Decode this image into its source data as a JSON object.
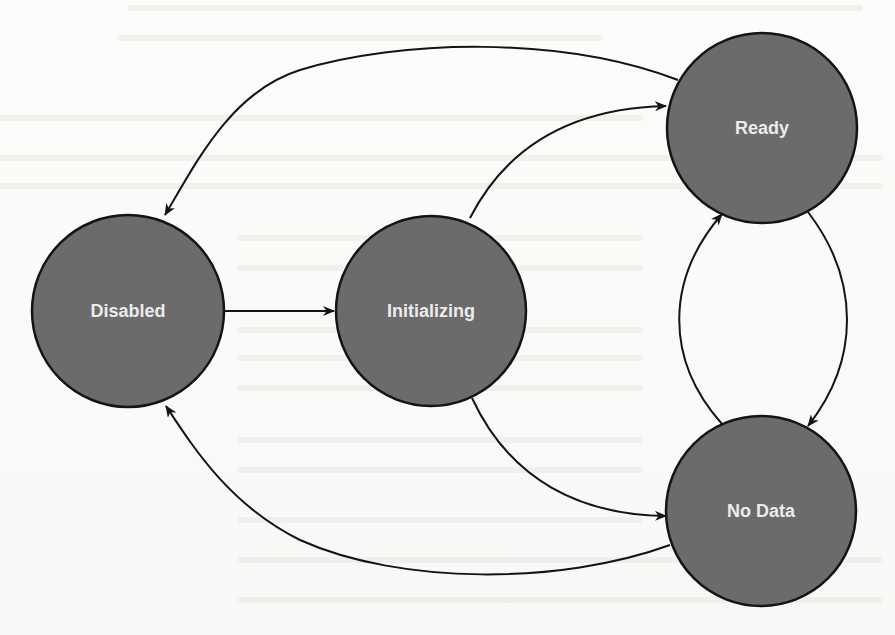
{
  "diagram": {
    "type": "state-transition",
    "colors": {
      "node_fill": "#6b6b6b",
      "node_stroke": "#141414",
      "edge": "#141414",
      "label": "#ececec",
      "background": "#fbfbfa"
    },
    "nodes": [
      {
        "id": "disabled",
        "label": "Disabled",
        "cx": 128,
        "cy": 311,
        "r": 96
      },
      {
        "id": "initializing",
        "label": "Initializing",
        "cx": 431,
        "cy": 311,
        "r": 95
      },
      {
        "id": "ready",
        "label": "Ready",
        "cx": 762,
        "cy": 128,
        "r": 95
      },
      {
        "id": "no_data",
        "label": "No Data",
        "cx": 761,
        "cy": 511,
        "r": 95
      }
    ],
    "edges": [
      {
        "from": "disabled",
        "to": "initializing"
      },
      {
        "from": "initializing",
        "to": "ready"
      },
      {
        "from": "initializing",
        "to": "no_data"
      },
      {
        "from": "ready",
        "to": "disabled"
      },
      {
        "from": "ready",
        "to": "no_data"
      },
      {
        "from": "no_data",
        "to": "ready"
      },
      {
        "from": "no_data",
        "to": "disabled"
      }
    ]
  }
}
